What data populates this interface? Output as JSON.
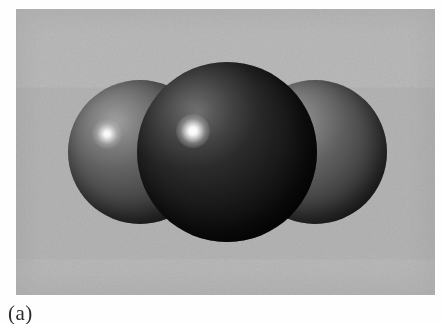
{
  "figure": {
    "caption_label": "(a)",
    "plate": {
      "background_color": "#b4b4b4",
      "left": 16,
      "top": 9,
      "width": 419,
      "height": 286
    },
    "atoms": [
      {
        "id": "atom-left",
        "role": "terminal",
        "shade": "mid-grey",
        "base_color": "#4a4a4a",
        "cx": 124,
        "cy": 143,
        "r": 72,
        "highlight": {
          "x": 91,
          "y": 125,
          "r": 15,
          "color": "#ffffff"
        }
      },
      {
        "id": "atom-center",
        "role": "central",
        "shade": "near-black",
        "base_color": "#141414",
        "cx": 211,
        "cy": 143,
        "r": 90,
        "highlight": {
          "x": 177,
          "y": 122,
          "r": 17,
          "color": "#ffffff"
        }
      },
      {
        "id": "atom-right",
        "role": "terminal",
        "shade": "mid-grey",
        "base_color": "#4a4a4a",
        "cx": 299,
        "cy": 143,
        "r": 72,
        "highlight": {
          "x": 276,
          "y": 124,
          "r": 13,
          "color": "#ffffff"
        }
      }
    ]
  }
}
